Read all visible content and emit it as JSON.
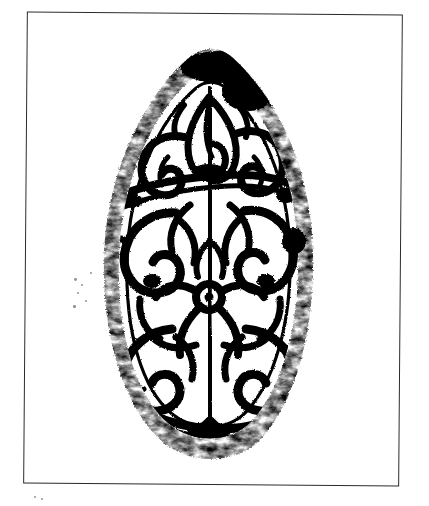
{
  "plate": {
    "medium": "ink rubbing",
    "background_color": "#ffffff",
    "ink_color": "#000000",
    "frame": {
      "border_color": "#2b2b2b",
      "border_width_px": 1.3,
      "left_px": 25,
      "top_px": 13,
      "width_px": 376,
      "height_px": 472,
      "rotation_deg": 0.45
    },
    "caption": "",
    "figure_number": ""
  },
  "artifact": {
    "name": "ogival ornamental tile rubbing",
    "silhouette": "pointed oval (ogee / almond) with rounded base",
    "apex_px": {
      "x": 232,
      "y": 58
    },
    "base_px": {
      "x": 215,
      "y": 455
    },
    "left_edge_px": 112,
    "right_edge_px": 325,
    "motif": "scrolling floral vine with central rosette boss",
    "border_band": "solid dark outer band with inner contour line",
    "central_boss_px": {
      "x": 205,
      "y": 300
    }
  },
  "specks": [
    {
      "x": 74,
      "y": 278,
      "r": 1.4
    },
    {
      "x": 81,
      "y": 284,
      "r": 1.0
    },
    {
      "x": 77,
      "y": 292,
      "r": 1.1
    },
    {
      "x": 85,
      "y": 300,
      "r": 0.9
    },
    {
      "x": 73,
      "y": 305,
      "r": 1.3
    },
    {
      "x": 90,
      "y": 272,
      "r": 0.9
    },
    {
      "x": 34,
      "y": 496,
      "r": 1.2
    },
    {
      "x": 41,
      "y": 498,
      "r": 1.0
    },
    {
      "x": 303,
      "y": 332,
      "r": 1.6
    },
    {
      "x": 296,
      "y": 339,
      "r": 1.1
    }
  ]
}
